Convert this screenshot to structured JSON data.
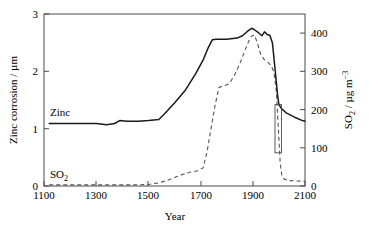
{
  "chart_data": {
    "type": "line",
    "title": "",
    "xlabel": "Year",
    "ylabel": "Zinc corrosion / µm",
    "ylabel_right": "SO2 / µg m-3",
    "ylabel_right_parts": {
      "base": "SO",
      "sub": "2",
      "unit": " / µg m",
      "sup": "−3"
    },
    "xlim": [
      1100,
      2100
    ],
    "ylim": [
      0,
      3
    ],
    "ylim_right": [
      0,
      450
    ],
    "xticks": [
      1100,
      1300,
      1500,
      1700,
      1900,
      2100
    ],
    "yticks": [
      0,
      1,
      2,
      3
    ],
    "yticks_right": [
      0,
      100,
      200,
      300,
      400
    ],
    "grid": false,
    "legend_position": "inline-annotations",
    "annotations": [
      {
        "text": "Zinc",
        "x": 1250,
        "y": 1.35,
        "series": "zinc"
      },
      {
        "text": "SO2",
        "text_base": "SO",
        "text_sub": "2",
        "x": 1220,
        "y": 0.25,
        "series": "so2"
      }
    ],
    "uncertainty_box": {
      "description": "open rectangle near year 2000 on zinc axis",
      "x_range": [
        1985,
        2010
      ],
      "y_range": [
        0.58,
        1.42
      ],
      "y_range_right": [
        87,
        213
      ]
    },
    "series": [
      {
        "name": "Zinc",
        "axis": "left",
        "style": "solid",
        "color": "#1a1a1a",
        "unit": "µm",
        "x": [
          1120,
          1180,
          1240,
          1300,
          1340,
          1370,
          1390,
          1420,
          1460,
          1500,
          1540,
          1560,
          1600,
          1640,
          1680,
          1710,
          1730,
          1745,
          1760,
          1800,
          1840,
          1860,
          1880,
          1895,
          1905,
          1920,
          1935,
          1945,
          1955,
          1965,
          1975,
          1985,
          1995,
          2000,
          2010,
          2030,
          2060,
          2090,
          2100
        ],
        "values": [
          1.09,
          1.09,
          1.09,
          1.09,
          1.07,
          1.09,
          1.14,
          1.13,
          1.13,
          1.14,
          1.16,
          1.25,
          1.45,
          1.66,
          1.95,
          2.2,
          2.42,
          2.55,
          2.56,
          2.56,
          2.58,
          2.62,
          2.7,
          2.75,
          2.73,
          2.68,
          2.62,
          2.69,
          2.64,
          2.63,
          2.5,
          2.05,
          1.58,
          1.42,
          1.35,
          1.27,
          1.2,
          1.14,
          1.13
        ]
      },
      {
        "name": "SO2",
        "axis": "right",
        "style": "dashed",
        "color": "#555555",
        "unit": "µg m-3",
        "x": [
          1120,
          1200,
          1280,
          1340,
          1400,
          1450,
          1500,
          1540,
          1570,
          1600,
          1630,
          1660,
          1690,
          1710,
          1725,
          1740,
          1755,
          1770,
          1790,
          1810,
          1830,
          1850,
          1870,
          1885,
          1895,
          1905,
          1915,
          1930,
          1945,
          1960,
          1970,
          1980,
          1990,
          1998,
          2005,
          2012,
          2020,
          2040,
          2070,
          2100
        ],
        "values": [
          3,
          3,
          3,
          3,
          3,
          3,
          4,
          8,
          14,
          22,
          30,
          36,
          40,
          48,
          90,
          150,
          210,
          258,
          262,
          268,
          290,
          320,
          355,
          380,
          392,
          395,
          380,
          345,
          330,
          322,
          315,
          300,
          250,
          150,
          60,
          25,
          18,
          14,
          13,
          12
        ]
      }
    ]
  },
  "axes": {
    "left_title": "Zinc corrosion / µm",
    "left_title_parts": {
      "text": "Zinc corrosion / µm"
    },
    "bottom_title": "Year",
    "right_title_base": "SO",
    "right_title_sub": "2",
    "right_title_unit": " / µg m",
    "right_title_sup": "−3",
    "xtick_labels": [
      "1100",
      "1300",
      "1500",
      "1700",
      "1900",
      "2100"
    ],
    "ytick_left_labels": [
      "0",
      "1",
      "2",
      "3"
    ],
    "ytick_right_labels": [
      "0",
      "100",
      "200",
      "300",
      "400"
    ]
  },
  "labels": {
    "zinc": "Zinc",
    "so2_base": "SO",
    "so2_sub": "2"
  },
  "colors": {
    "zinc_line": "#1a1a1a",
    "so2_line": "#555555",
    "frame": "#4a4a4a",
    "background": "#ffffff",
    "text": "#000000"
  }
}
